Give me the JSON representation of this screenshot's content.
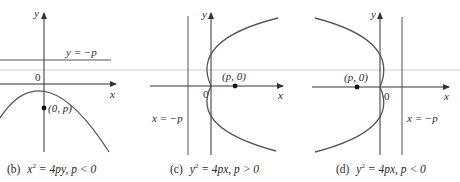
{
  "figure": {
    "panels": [
      {
        "id": "b",
        "caption_tag": "(b)",
        "caption_eq_lhs": "x",
        "caption_eq_exp": "2",
        "caption_eq_rhs": " = 4py, p < 0",
        "directrix_label": "y = −p",
        "focus_label": "(0, p)",
        "origin_label": "0",
        "x_axis_label": "x",
        "y_axis_label": "y"
      },
      {
        "id": "c",
        "caption_tag": "(c)",
        "caption_eq_lhs": "y",
        "caption_eq_exp": "2",
        "caption_eq_rhs": " = 4px, p > 0",
        "directrix_label": "x = −p",
        "focus_label": "(p, 0)",
        "origin_label": "0",
        "x_axis_label": "x",
        "y_axis_label": "y"
      },
      {
        "id": "d",
        "caption_tag": "(d)",
        "caption_eq_lhs": "y",
        "caption_eq_exp": "2",
        "caption_eq_rhs": " = 4px, p < 0",
        "directrix_label": "x = −p",
        "focus_label": "(p, 0)",
        "origin_label": "0",
        "x_axis_label": "x",
        "y_axis_label": "y"
      }
    ],
    "colors": {
      "axis": "#333333",
      "curve": "#555555",
      "scan_line": "#cfcfcf",
      "text": "#2a2a2a"
    }
  }
}
